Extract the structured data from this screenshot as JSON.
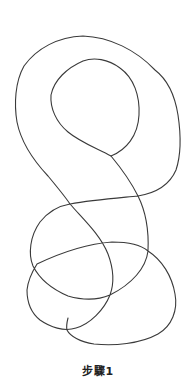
{
  "figure": {
    "stroke_color": "#3a3a3a",
    "background": "#ffffff",
    "caption": "步驟1"
  }
}
